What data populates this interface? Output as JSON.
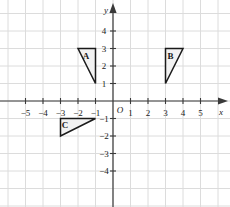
{
  "chart_data": {
    "type": "scatter",
    "title": "",
    "xlabel": "x",
    "ylabel": "y",
    "xlim": [
      -6,
      6
    ],
    "ylim": [
      -5,
      5
    ],
    "grid": true,
    "legend": "none",
    "origin_label": "O",
    "x_ticks": [
      -5,
      -4,
      -3,
      -2,
      -1,
      1,
      2,
      3,
      4,
      5
    ],
    "y_ticks": [
      -4,
      -3,
      -2,
      -1,
      1,
      2,
      3,
      4
    ],
    "x_tick_labels": [
      "−5",
      "−4",
      "−3",
      "−2",
      "−1",
      "1",
      "2",
      "3",
      "4",
      "5"
    ],
    "y_tick_labels": [
      "−4",
      "−3",
      "−2",
      "−1",
      "1",
      "2",
      "3",
      "4"
    ],
    "shapes": [
      {
        "name": "A",
        "label": "A",
        "kind": "triangle",
        "vertices": [
          [
            -2,
            3
          ],
          [
            -1,
            3
          ],
          [
            -1,
            1
          ]
        ],
        "label_point": [
          -1.55,
          2.55
        ],
        "fill": "#f2f2f2",
        "stroke": "#1a1a1a"
      },
      {
        "name": "B",
        "label": "B",
        "kind": "triangle",
        "vertices": [
          [
            3,
            3
          ],
          [
            4,
            3
          ],
          [
            3,
            1
          ]
        ],
        "label_point": [
          3.28,
          2.55
        ],
        "fill": "#f2f2f2",
        "stroke": "#1a1a1a"
      },
      {
        "name": "C",
        "label": "C",
        "kind": "triangle",
        "vertices": [
          [
            -3,
            -1
          ],
          [
            -1,
            -1
          ],
          [
            -3,
            -2
          ]
        ],
        "label_point": [
          -2.75,
          -1.35
        ],
        "fill": "#f2f2f2",
        "stroke": "#1a1a1a"
      }
    ]
  },
  "style": {
    "grid_color": "#dcdcdc",
    "axis_color": "#3a3a3a",
    "background": "#ffffff",
    "shape_fill": "#f2f2f2",
    "shape_stroke": "#1a1a1a"
  }
}
